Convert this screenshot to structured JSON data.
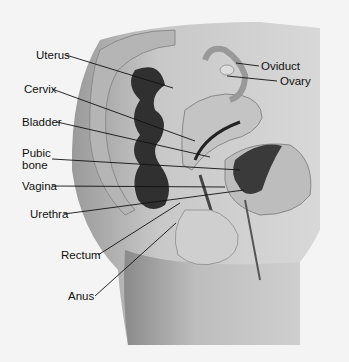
{
  "diagram": {
    "labels": {
      "uterus": "Uterus",
      "cervix": "Cervix",
      "bladder": "Bladder",
      "pubic_bone_1": "Pubic",
      "pubic_bone_2": "bone",
      "vagina": "Vagina",
      "urethra": "Urethra",
      "rectum": "Rectum",
      "anus": "Anus",
      "oviduct": "Oviduct",
      "ovary": "Ovary"
    }
  }
}
